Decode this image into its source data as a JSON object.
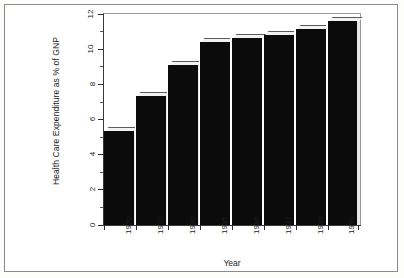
{
  "chart_data": {
    "type": "bar",
    "title": "",
    "categories": [
      "1960",
      "1970",
      "1980",
      "1985",
      "1986",
      "1987",
      "1988",
      "1989"
    ],
    "values": [
      5.3,
      7.3,
      9.1,
      10.4,
      10.6,
      10.8,
      11.1,
      11.6
    ],
    "xlabel": "Year",
    "ylabel": "Health Care Expenditure as % of GNP",
    "ylim": [
      0,
      12
    ],
    "yticks": [
      0,
      2,
      4,
      6,
      8,
      10,
      12
    ],
    "ytick_labels": [
      "0",
      "2",
      "4",
      "6",
      "8",
      "10",
      "12"
    ],
    "grid": false,
    "legend": null,
    "bar_color": "#0b0b0b",
    "bar_highlight_color": "#f2f2f2",
    "axis_color": "#3a3a3a",
    "background_color": "#ffffff",
    "style": "3d-extruded-bars"
  },
  "figure": {
    "border_color": "#8b8b8b"
  }
}
